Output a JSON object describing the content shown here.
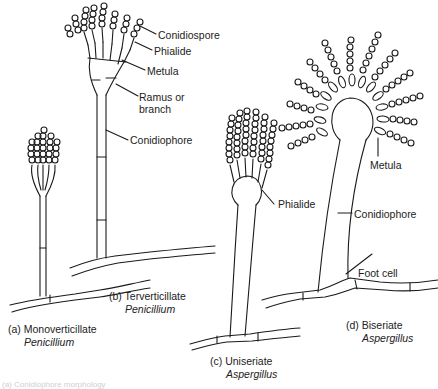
{
  "figure": {
    "labels": {
      "conidiospore": "Conidiospore",
      "phialide_b": "Phialide",
      "metula_b": "Metula",
      "ramus_line1": "Ramus or",
      "ramus_line2": "branch",
      "conidiophore_b": "Conidiophore",
      "phialide_c": "Phialide",
      "metula_d": "Metula",
      "conidiophore_d": "Conidiophore",
      "foot_cell": "Foot cell"
    },
    "panels": [
      {
        "id": "a",
        "caption": "(a) Monoverticillate",
        "genus": "Penicillium"
      },
      {
        "id": "b",
        "caption": "(b) Terverticillate",
        "genus": "Penicillium"
      },
      {
        "id": "c",
        "caption": "(c) Uniseriate",
        "genus": "Aspergillus"
      },
      {
        "id": "d",
        "caption": "(d) Biseriate",
        "genus": "Aspergillus"
      }
    ],
    "footer_caption": "(a) Conidiophore morphology"
  },
  "colors": {
    "line": "#1a1a1a",
    "background": "#ffffff",
    "text": "#222222"
  }
}
